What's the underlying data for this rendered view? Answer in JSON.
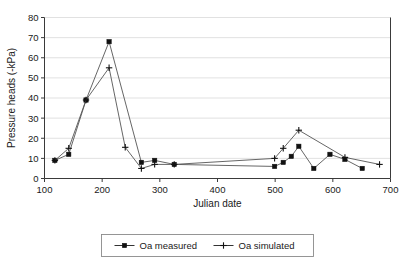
{
  "chart_data": {
    "type": "line",
    "title": "",
    "xlabel": "Julian date",
    "ylabel": "Pressure heads (-kPa)",
    "xlim": [
      100,
      700
    ],
    "ylim": [
      0,
      80
    ],
    "xticks": [
      100,
      200,
      300,
      400,
      500,
      600,
      700
    ],
    "yticks": [
      0,
      10,
      20,
      30,
      40,
      50,
      60,
      70,
      80
    ],
    "xtick_labels": [
      "100",
      "200",
      "300",
      "400",
      "500",
      "600",
      "700"
    ],
    "ytick_labels": [
      "0",
      "10",
      "20",
      "30",
      "40",
      "50",
      "60",
      "70",
      "80"
    ],
    "grid": "horizontal",
    "legend_position": "bottom",
    "series": [
      {
        "name": "Oa measured",
        "marker": "square",
        "x": [
          118,
          142,
          172,
          212,
          268,
          291,
          325,
          499,
          514,
          528,
          541,
          567,
          595,
          621,
          651
        ],
        "y": [
          9,
          12,
          39,
          68,
          8,
          9,
          7,
          6,
          8,
          11,
          16,
          5,
          12,
          9.5,
          5
        ]
      },
      {
        "name": "Oa simulated",
        "marker": "plus",
        "x": [
          118,
          142,
          172,
          212,
          240,
          268,
          291,
          325,
          499,
          514,
          541,
          621,
          681
        ],
        "y": [
          9,
          15,
          39,
          55,
          15.5,
          5,
          7,
          7,
          10,
          15,
          24,
          10.5,
          7
        ]
      }
    ]
  },
  "legend": {
    "items": [
      {
        "label": "Oa measured",
        "marker": "square"
      },
      {
        "label": "Oa simulated",
        "marker": "plus"
      }
    ]
  }
}
